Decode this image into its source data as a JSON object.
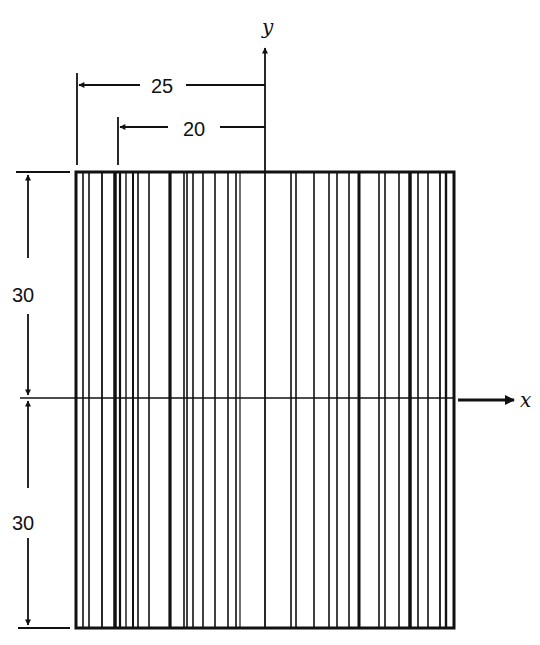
{
  "figure": {
    "axes": {
      "x_label": "x",
      "y_label": "y"
    },
    "dimensions": {
      "top_outer": "25",
      "top_inner": "20",
      "left_upper": "30",
      "left_lower": "30"
    },
    "rectangle": {
      "left": 76,
      "right": 454,
      "top": 172,
      "bottom": 628,
      "x_axis_y": 398,
      "y_axis_x": 265
    },
    "vertical_lines": [
      {
        "x": 83,
        "w": 1.6
      },
      {
        "x": 89,
        "w": 1.6
      },
      {
        "x": 102,
        "w": 1.8
      },
      {
        "x": 115,
        "w": 3.5
      },
      {
        "x": 120,
        "w": 2.2
      },
      {
        "x": 126,
        "w": 1.4
      },
      {
        "x": 133,
        "w": 2
      },
      {
        "x": 138,
        "w": 1.6
      },
      {
        "x": 149,
        "w": 1.6
      },
      {
        "x": 170,
        "w": 3.2
      },
      {
        "x": 184,
        "w": 1.6
      },
      {
        "x": 187,
        "w": 1.6
      },
      {
        "x": 193,
        "w": 1.6
      },
      {
        "x": 203,
        "w": 1.6
      },
      {
        "x": 215,
        "w": 1.6
      },
      {
        "x": 228,
        "w": 1.6
      },
      {
        "x": 236,
        "w": 1.6
      },
      {
        "x": 240,
        "w": 1.2
      },
      {
        "x": 291,
        "w": 1.6
      },
      {
        "x": 296,
        "w": 1.6
      },
      {
        "x": 314,
        "w": 1.6
      },
      {
        "x": 329,
        "w": 1.6
      },
      {
        "x": 337,
        "w": 1.6
      },
      {
        "x": 349,
        "w": 1.6
      },
      {
        "x": 359,
        "w": 3
      },
      {
        "x": 379,
        "w": 1.6
      },
      {
        "x": 385,
        "w": 1.6
      },
      {
        "x": 399,
        "w": 1.6
      },
      {
        "x": 410,
        "w": 3.5
      },
      {
        "x": 418,
        "w": 1.6
      },
      {
        "x": 428,
        "w": 1.6
      },
      {
        "x": 440,
        "w": 1.8
      },
      {
        "x": 446,
        "w": 2.4
      }
    ],
    "colors": {
      "ink": "#111111",
      "background": "#ffffff"
    }
  }
}
